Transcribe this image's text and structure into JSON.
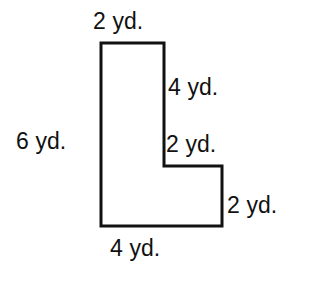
{
  "figure": {
    "units": "yd.",
    "stroke_color": "#111111",
    "fill_color": "#ffffff",
    "background_color": "#ffffff",
    "stroke_width": 3,
    "labels": {
      "top": "2 yd.",
      "right_upper": "4 yd.",
      "left": "6 yd.",
      "inner_horizontal": "2 yd.",
      "right_lower": "2 yd.",
      "bottom": "4 yd."
    },
    "vertices": [
      [
        101,
        43
      ],
      [
        164,
        43
      ],
      [
        164,
        166
      ],
      [
        222,
        166
      ],
      [
        222,
        226
      ],
      [
        101,
        226
      ]
    ],
    "side_measurements": [
      {
        "side": "top",
        "value": 2,
        "unit": "yd."
      },
      {
        "side": "right_upper",
        "value": 4,
        "unit": "yd."
      },
      {
        "side": "inner_horizontal",
        "value": 2,
        "unit": "yd."
      },
      {
        "side": "right_lower",
        "value": 2,
        "unit": "yd."
      },
      {
        "side": "bottom",
        "value": 4,
        "unit": "yd."
      },
      {
        "side": "left",
        "value": 6,
        "unit": "yd."
      }
    ]
  }
}
